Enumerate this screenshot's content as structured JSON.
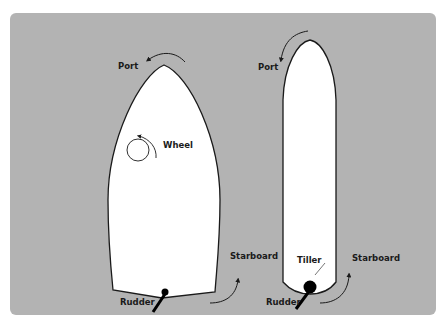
{
  "diagram": {
    "background_color": "#b3b3b3",
    "hull_color": "#ffffff",
    "left_boat": {
      "name": "wheel-steered boat",
      "labels": {
        "port": "Port",
        "wheel": "Wheel",
        "starboard": "Starboard",
        "rudder": "Rudder"
      }
    },
    "right_boat": {
      "name": "tiller-steered boat",
      "labels": {
        "port": "Port",
        "tiller": "Tiller",
        "starboard": "Starboard",
        "rudder": "Rudder"
      }
    }
  }
}
